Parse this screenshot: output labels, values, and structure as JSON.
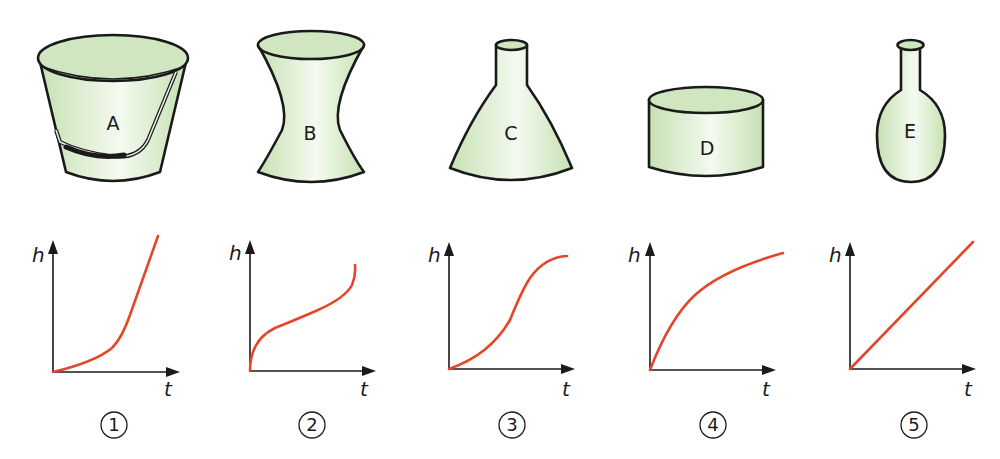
{
  "containers": [
    {
      "id": "A",
      "label": "A",
      "shape": "bucket"
    },
    {
      "id": "B",
      "label": "B",
      "shape": "hourglass-vase"
    },
    {
      "id": "C",
      "label": "C",
      "shape": "conical-flask"
    },
    {
      "id": "D",
      "label": "D",
      "shape": "cylinder"
    },
    {
      "id": "E",
      "label": "E",
      "shape": "round-bottom-flask"
    }
  ],
  "graphs": [
    {
      "number": "1",
      "y_axis_label": "h",
      "x_axis_label": "t",
      "curve": "slow then fast (concave up, then steep linear)"
    },
    {
      "number": "2",
      "y_axis_label": "h",
      "x_axis_label": "t",
      "curve": "fast, slow, then fast (inflection)"
    },
    {
      "number": "3",
      "y_axis_label": "h",
      "x_axis_label": "t",
      "curve": "slow, fast, then slow (S-shape)"
    },
    {
      "number": "4",
      "y_axis_label": "h",
      "x_axis_label": "t",
      "curve": "fast then slowing (concave down)"
    },
    {
      "number": "5",
      "y_axis_label": "h",
      "x_axis_label": "t",
      "curve": "linear"
    }
  ],
  "colors": {
    "container_fill": "#cfe6c0",
    "container_highlight": "#f4faef",
    "outline": "#1a1a1a",
    "curve": "#e2472a"
  }
}
